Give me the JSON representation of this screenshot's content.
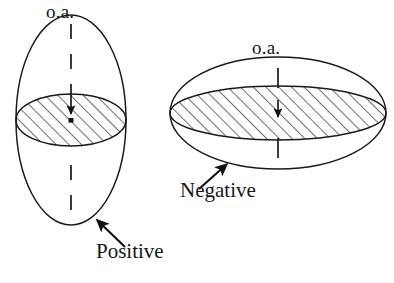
{
  "figure": {
    "type": "diagram",
    "background_color": "#ffffff",
    "stroke_color": "#1a1a1a",
    "hatch_color": "#1a1a1a",
    "width": 394,
    "height": 283
  },
  "left_figure": {
    "name": "positive-uniaxial-indicatrix",
    "shape": "prolate-ellipsoid",
    "axis_label": "o.a.",
    "sign_label": "Positive",
    "center": {
      "x": 71,
      "y": 120
    },
    "outline_rx": 55,
    "outline_ry": 105,
    "section_rx": 55,
    "section_ry": 26,
    "section_hatched": true,
    "axis_orientation": "vertical",
    "axis_dashed": true,
    "center_marker": "square-dot",
    "arrow": {
      "name": "positive-callout-arrow",
      "from": {
        "x": 125,
        "y": 247
      },
      "to": {
        "x": 95,
        "y": 218
      }
    }
  },
  "right_figure": {
    "name": "negative-uniaxial-indicatrix",
    "shape": "oblate-ellipsoid",
    "axis_label": "o.a.",
    "sign_label": "Negative",
    "center": {
      "x": 278,
      "y": 113
    },
    "outline_rx": 108,
    "outline_ry": 56,
    "section_rx": 108,
    "section_ry": 27,
    "section_hatched": true,
    "axis_orientation": "vertical",
    "axis_dashed": false,
    "center_marker": "arrowhead-tick",
    "arrow": {
      "name": "negative-callout-arrow",
      "from": {
        "x": 199,
        "y": 188
      },
      "to": {
        "x": 228,
        "y": 163
      }
    }
  },
  "labels": {
    "oa_left": "o.a.",
    "oa_right": "o.a.",
    "positive": "Positive",
    "negative": "Negative"
  }
}
